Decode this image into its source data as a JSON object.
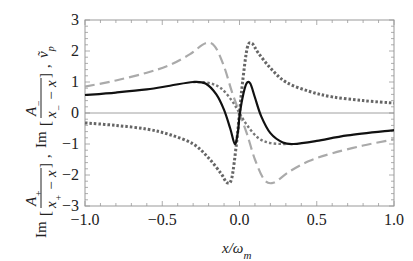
{
  "chart_data": {
    "type": "line",
    "title": "",
    "xlabel": "x/ω_m",
    "ylabel": "Im[A+/(x+ − x)], Im[A−/(x− − x)], ṽ_p",
    "xlim": [
      -1.0,
      1.0
    ],
    "ylim": [
      -3,
      3
    ],
    "x_ticks": [
      "-1.0",
      "-0.5",
      "0.0",
      "0.5",
      "1.0"
    ],
    "y_ticks": [
      "3",
      "2",
      "1",
      "0",
      "-1",
      "-2",
      "-3"
    ],
    "grid": false,
    "legend": "none",
    "zero_line": true,
    "series": [
      {
        "name": "v_p (solid black)",
        "style": "solid",
        "color": "#111111",
        "points": [
          [
            -1.0,
            0.58
          ],
          [
            -0.8,
            0.66
          ],
          [
            -0.6,
            0.76
          ],
          [
            -0.45,
            0.88
          ],
          [
            -0.3,
            1.0
          ],
          [
            -0.22,
            0.95
          ],
          [
            -0.15,
            0.6
          ],
          [
            -0.1,
            0.1
          ],
          [
            -0.06,
            -0.5
          ],
          [
            -0.03,
            -1.0
          ],
          [
            -0.01,
            -0.6
          ],
          [
            0.0,
            -0.1
          ],
          [
            0.02,
            0.5
          ],
          [
            0.045,
            0.95
          ],
          [
            0.07,
            0.95
          ],
          [
            0.1,
            0.5
          ],
          [
            0.14,
            -0.1
          ],
          [
            0.2,
            -0.65
          ],
          [
            0.28,
            -0.95
          ],
          [
            0.35,
            -1.0
          ],
          [
            0.5,
            -0.9
          ],
          [
            0.7,
            -0.72
          ],
          [
            1.0,
            -0.55
          ]
        ]
      },
      {
        "name": "Im[A-/(x- - x)] (light dashed)",
        "style": "dashed",
        "color": "#aaaaaa",
        "points": [
          [
            -1.0,
            0.85
          ],
          [
            -0.8,
            1.05
          ],
          [
            -0.6,
            1.3
          ],
          [
            -0.45,
            1.55
          ],
          [
            -0.32,
            1.9
          ],
          [
            -0.22,
            2.25
          ],
          [
            -0.16,
            2.15
          ],
          [
            -0.1,
            1.5
          ],
          [
            -0.05,
            0.7
          ],
          [
            0.0,
            0.0
          ],
          [
            0.05,
            -0.7
          ],
          [
            0.1,
            -1.5
          ],
          [
            0.16,
            -2.15
          ],
          [
            0.22,
            -2.25
          ],
          [
            0.32,
            -1.9
          ],
          [
            0.45,
            -1.55
          ],
          [
            0.6,
            -1.3
          ],
          [
            0.8,
            -1.05
          ],
          [
            1.0,
            -0.85
          ]
        ]
      },
      {
        "name": "Im[A+/(x+ - x)] (dark dotted)",
        "style": "dotted",
        "color": "#666666",
        "points": [
          [
            -1.0,
            -0.32
          ],
          [
            -0.8,
            -0.4
          ],
          [
            -0.6,
            -0.52
          ],
          [
            -0.45,
            -0.7
          ],
          [
            -0.3,
            -1.0
          ],
          [
            -0.2,
            -1.45
          ],
          [
            -0.12,
            -1.95
          ],
          [
            -0.08,
            -2.25
          ],
          [
            -0.05,
            -2.1
          ],
          [
            -0.02,
            -1.0
          ],
          [
            0.0,
            0.0
          ],
          [
            0.02,
            1.0
          ],
          [
            0.05,
            2.1
          ],
          [
            0.08,
            2.25
          ],
          [
            0.12,
            1.95
          ],
          [
            0.2,
            1.45
          ],
          [
            0.3,
            1.0
          ],
          [
            0.45,
            0.7
          ],
          [
            0.6,
            0.52
          ],
          [
            0.8,
            0.4
          ],
          [
            1.0,
            0.32
          ]
        ]
      },
      {
        "name": "auxiliary (gray dotted, small)",
        "style": "dotted-fine",
        "color": "#777777",
        "points": [
          [
            -0.3,
            1.0
          ],
          [
            -0.2,
            0.97
          ],
          [
            -0.12,
            0.8
          ],
          [
            -0.05,
            0.4
          ],
          [
            0.0,
            0.0
          ],
          [
            0.05,
            -0.4
          ],
          [
            0.12,
            -0.8
          ],
          [
            0.2,
            -0.97
          ],
          [
            0.3,
            -1.0
          ]
        ]
      }
    ]
  },
  "axes": {
    "x_label_main": "x/ω",
    "x_label_sub": "m",
    "y_label_parts": [
      "Im",
      "A",
      "+",
      "x",
      "+",
      "− x",
      "Im",
      "A",
      "−",
      "x",
      "−",
      "− x",
      "v",
      "p"
    ]
  }
}
